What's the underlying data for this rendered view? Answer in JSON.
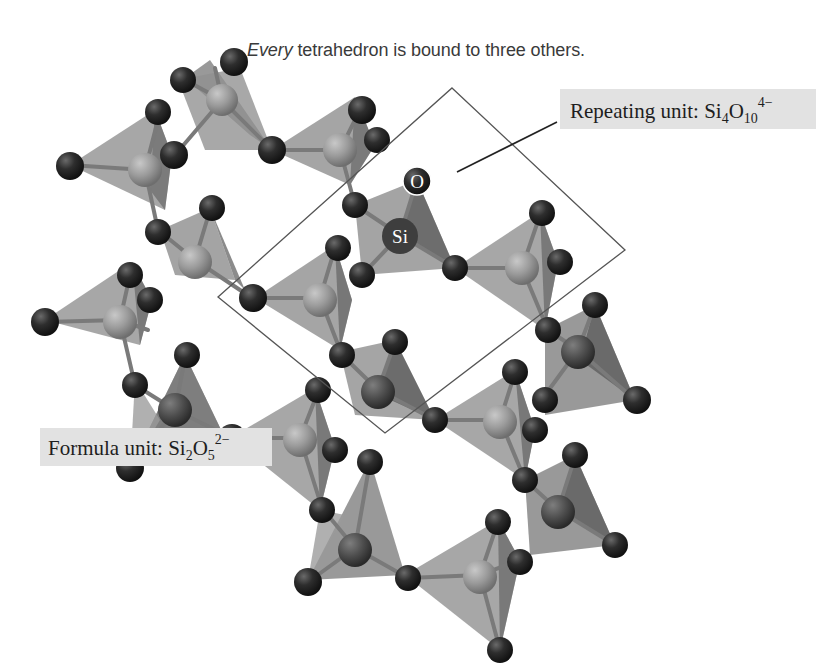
{
  "figure": {
    "title_emphasis": "Every",
    "title_rest": " tetrahedron is bound to three others.",
    "repeating_unit": {
      "prefix": "Repeating unit: Si",
      "sub1": "4",
      "mid": "O",
      "sub2": "10",
      "charge": "4−"
    },
    "formula_unit": {
      "prefix": "Formula unit: Si",
      "sub1": "2",
      "mid": "O",
      "sub2": "5",
      "charge": "2−"
    },
    "atom_labels": {
      "oxygen": "O",
      "silicon": "Si"
    },
    "colors": {
      "oxygen": "#2b2b2b",
      "silicon_light": "#9a9a9a",
      "silicon_dark": "#4a4a4a",
      "tetrahedron_face": "#8c8c8c",
      "label_bg": "#e2e2e2",
      "outline": "#555555"
    }
  }
}
